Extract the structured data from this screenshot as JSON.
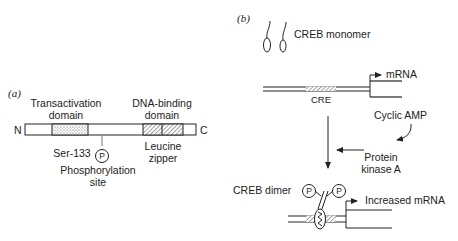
{
  "panel_a": {
    "label": "(a)",
    "n_terminus": "N",
    "c_terminus": "C",
    "transactivation_line1": "Transactivation",
    "transactivation_line2": "domain",
    "dna_binding_line1": "DNA-binding",
    "dna_binding_line2": "domain",
    "ser_label": "Ser-133",
    "p_symbol": "P",
    "phospho_line1": "Phosphorylation",
    "phospho_line2": "site",
    "leucine_line1": "Leucine",
    "leucine_line2": "zipper"
  },
  "panel_b": {
    "label": "(b)",
    "monomer_label": "CREB monomer",
    "mrna_label": "mRNA",
    "cre_label": "CRE",
    "camp_label": "Cyclic AMP",
    "pka_line1": "Protein",
    "pka_line2": "kinase A",
    "dimer_label": "CREB dimer",
    "p_symbol": "P",
    "increased_label": "Increased mRNA"
  }
}
